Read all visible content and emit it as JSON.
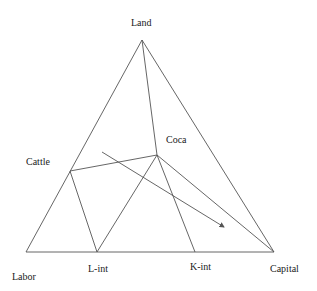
{
  "diagram": {
    "type": "ternary-triangle",
    "line_color": "#555555",
    "text_color": "#222222",
    "vertices": {
      "land": {
        "label": "Land",
        "x": 142,
        "y": 40
      },
      "labor": {
        "label": "Labor",
        "x": 26,
        "y": 252
      },
      "capital": {
        "label": "Capital",
        "x": 274,
        "y": 252
      }
    },
    "points": {
      "cattle": {
        "label": "Cattle",
        "x": 70,
        "y": 171
      },
      "coca": {
        "label": "Coca",
        "x": 157,
        "y": 155
      },
      "l_int": {
        "label": "L-int",
        "x": 97,
        "y": 252
      },
      "k_int": {
        "label": "K-int",
        "x": 195,
        "y": 252
      }
    },
    "labels": {
      "land": {
        "text": "Land",
        "x": 131,
        "y": 26
      },
      "cattle": {
        "text": "Cattle",
        "x": 26,
        "y": 165
      },
      "coca": {
        "text": "Coca",
        "x": 166,
        "y": 143
      },
      "labor": {
        "text": "Labor",
        "x": 12,
        "y": 280
      },
      "l_int": {
        "text": "L-int",
        "x": 88,
        "y": 272
      },
      "k_int": {
        "text": "K-int",
        "x": 190,
        "y": 270
      },
      "capital": {
        "text": "Capital",
        "x": 270,
        "y": 272
      }
    },
    "arrow": {
      "x1": 102,
      "y1": 152,
      "x2": 224,
      "y2": 227
    }
  }
}
